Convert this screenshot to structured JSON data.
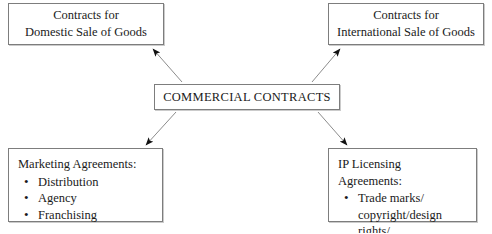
{
  "diagram": {
    "type": "hub-and-spoke",
    "background_color": "#ffffff",
    "border_color": "#7d7d7d",
    "text_color": "#1a1a1a",
    "center": {
      "label": "COMMERCIAL CONTRACTS"
    },
    "nodes": {
      "domestic": {
        "line1": "Contracts for",
        "line2": "Domestic Sale of Goods"
      },
      "international": {
        "line1": "Contracts for",
        "line2": "International Sale of Goods"
      },
      "marketing": {
        "heading": "Marketing Agreements:",
        "items": [
          "Distribution",
          "Agency",
          "Franchising"
        ]
      },
      "ip": {
        "heading": "IP Licensing Agreements:",
        "items_line1": "Trade marks/",
        "items_line2": "copyright/design rights/",
        "items_line3": "patents"
      }
    },
    "edges": [
      {
        "from": "center",
        "to": "domestic",
        "arrow": "to"
      },
      {
        "from": "center",
        "to": "international",
        "arrow": "to"
      },
      {
        "from": "center",
        "to": "marketing",
        "arrow": "to"
      },
      {
        "from": "center",
        "to": "ip",
        "arrow": "to"
      }
    ]
  }
}
